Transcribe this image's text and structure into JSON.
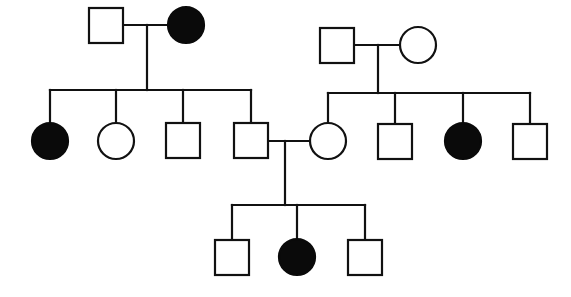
{
  "diagram": {
    "type": "pedigree-chart",
    "colors": {
      "affected": "#0a0a0a",
      "unaffected": "#ffffff",
      "stroke": "#111111"
    },
    "legend": {
      "square": "male",
      "circle": "female",
      "filled": "affected",
      "open": "unaffected"
    },
    "individuals": [
      {
        "id": "I-1",
        "generation": 1,
        "sex": "male",
        "affected": false,
        "x": 106,
        "y": 25
      },
      {
        "id": "I-2",
        "generation": 1,
        "sex": "female",
        "affected": true,
        "x": 186,
        "y": 25
      },
      {
        "id": "I-3",
        "generation": 1,
        "sex": "male",
        "affected": false,
        "x": 337,
        "y": 45
      },
      {
        "id": "I-4",
        "generation": 1,
        "sex": "female",
        "affected": false,
        "x": 418,
        "y": 45
      },
      {
        "id": "II-1",
        "generation": 2,
        "sex": "female",
        "affected": true,
        "x": 50,
        "y": 141
      },
      {
        "id": "II-2",
        "generation": 2,
        "sex": "female",
        "affected": false,
        "x": 116,
        "y": 141
      },
      {
        "id": "II-3",
        "generation": 2,
        "sex": "male",
        "affected": false,
        "x": 183,
        "y": 141
      },
      {
        "id": "II-4",
        "generation": 2,
        "sex": "male",
        "affected": false,
        "x": 251,
        "y": 141
      },
      {
        "id": "II-5",
        "generation": 2,
        "sex": "female",
        "affected": false,
        "x": 328,
        "y": 141
      },
      {
        "id": "II-6",
        "generation": 2,
        "sex": "male",
        "affected": false,
        "x": 395,
        "y": 141
      },
      {
        "id": "II-7",
        "generation": 2,
        "sex": "female",
        "affected": true,
        "x": 463,
        "y": 141
      },
      {
        "id": "II-8",
        "generation": 2,
        "sex": "male",
        "affected": false,
        "x": 530,
        "y": 141
      },
      {
        "id": "III-1",
        "generation": 3,
        "sex": "male",
        "affected": false,
        "x": 232,
        "y": 257
      },
      {
        "id": "III-2",
        "generation": 3,
        "sex": "female",
        "affected": true,
        "x": 297,
        "y": 257
      },
      {
        "id": "III-3",
        "generation": 3,
        "sex": "male",
        "affected": false,
        "x": 365,
        "y": 257
      }
    ],
    "matings": [
      {
        "partners": [
          "I-1",
          "I-2"
        ],
        "children": [
          "II-1",
          "II-2",
          "II-3",
          "II-4"
        ]
      },
      {
        "partners": [
          "I-3",
          "I-4"
        ],
        "children": [
          "II-5",
          "II-6",
          "II-7",
          "II-8"
        ]
      },
      {
        "partners": [
          "II-4",
          "II-5"
        ],
        "children": [
          "III-1",
          "III-2",
          "III-3"
        ]
      }
    ]
  }
}
